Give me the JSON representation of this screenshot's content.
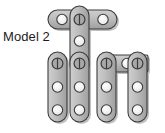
{
  "figure": {
    "title": "Model 2",
    "type": "construction-toy-assembly-diagram",
    "background_color": "#ffffff",
    "strip_fill_color": "#b4b4b4",
    "strip_stroke_color": "#3c3c3c",
    "strip_shadow_color": "#8c8c8c",
    "hole_fill_color": "#f2f2f2",
    "hole_stroke_color": "#3c3c3c",
    "pin_line_color": "#3c3c3c",
    "label_text_color": "#1c1c1c"
  },
  "label": {
    "text": "Model 2",
    "x": 3,
    "y": 30,
    "font_size": 13
  },
  "parts": [
    {
      "id": "top-horizontal-strip",
      "name": "top-horizontal-strip",
      "orientation": "horizontal",
      "holes": 3,
      "x": 48,
      "y": 10,
      "width": 69,
      "height": 19,
      "hole_centers": [
        [
          62,
          19
        ],
        [
          82,
          19
        ],
        [
          103,
          19
        ]
      ]
    },
    {
      "id": "center-upper-vertical-strip",
      "name": "center-upper-vertical-strip",
      "orientation": "vertical",
      "holes": 3,
      "x": 70,
      "y": 6,
      "width": 19,
      "height": 69,
      "hole_centers": [
        [
          79,
          19
        ],
        [
          79,
          41
        ],
        [
          79,
          63
        ]
      ]
    },
    {
      "id": "left-vertical-strip",
      "name": "left-vertical-strip",
      "orientation": "vertical",
      "holes": 3,
      "x": 48,
      "y": 52,
      "width": 19,
      "height": 70,
      "hole_centers": [
        [
          57,
          63
        ],
        [
          57,
          87
        ],
        [
          57,
          110
        ]
      ]
    },
    {
      "id": "center-lower-vertical-strip",
      "name": "center-lower-vertical-strip",
      "orientation": "vertical",
      "holes": 3,
      "x": 70,
      "y": 52,
      "width": 19,
      "height": 70,
      "hole_centers": [
        [
          79,
          63
        ],
        [
          79,
          87
        ],
        [
          79,
          110
        ]
      ]
    },
    {
      "id": "right-inner-vertical-strip",
      "name": "right-inner-vertical-strip",
      "orientation": "vertical",
      "holes": 3,
      "x": 97,
      "y": 52,
      "width": 19,
      "height": 70,
      "hole_centers": [
        [
          106,
          63
        ],
        [
          106,
          87
        ],
        [
          106,
          110
        ]
      ]
    },
    {
      "id": "lower-horizontal-strip",
      "name": "lower-horizontal-strip",
      "orientation": "horizontal",
      "holes": 1,
      "x": 106,
      "y": 55,
      "width": 42,
      "height": 17,
      "hole_centers": [
        [
          127,
          63
        ]
      ]
    },
    {
      "id": "right-outer-vertical-strip",
      "name": "right-outer-vertical-strip",
      "orientation": "vertical",
      "holes": 3,
      "x": 128,
      "y": 52,
      "width": 19,
      "height": 70,
      "hole_centers": [
        [
          137,
          63
        ],
        [
          137,
          87
        ],
        [
          137,
          110
        ]
      ]
    }
  ],
  "pins": [
    {
      "name": "pin-top-center",
      "x": 79,
      "y": 19
    },
    {
      "name": "pin-left-joint",
      "x": 57,
      "y": 63
    },
    {
      "name": "pin-center-joint",
      "x": 79,
      "y": 63
    },
    {
      "name": "pin-right-inner-joint",
      "x": 106,
      "y": 63
    },
    {
      "name": "pin-right-outer-joint",
      "x": 137,
      "y": 63
    }
  ],
  "plain_holes": [
    {
      "name": "hole-top-left",
      "x": 62,
      "y": 19
    },
    {
      "name": "hole-top-right",
      "x": 103,
      "y": 19
    },
    {
      "name": "hole-center-upper-mid",
      "x": 79,
      "y": 41
    },
    {
      "name": "hole-left-mid",
      "x": 57,
      "y": 87
    },
    {
      "name": "hole-left-bottom",
      "x": 57,
      "y": 110
    },
    {
      "name": "hole-center-lower-mid",
      "x": 79,
      "y": 87
    },
    {
      "name": "hole-center-lower-bottom",
      "x": 79,
      "y": 110
    },
    {
      "name": "hole-right-inner-mid",
      "x": 106,
      "y": 87
    },
    {
      "name": "hole-right-inner-bottom",
      "x": 106,
      "y": 110
    },
    {
      "name": "hole-lower-horizontal-center",
      "x": 127,
      "y": 63
    },
    {
      "name": "hole-right-outer-mid",
      "x": 137,
      "y": 87
    },
    {
      "name": "hole-right-outer-bottom",
      "x": 137,
      "y": 110
    }
  ]
}
